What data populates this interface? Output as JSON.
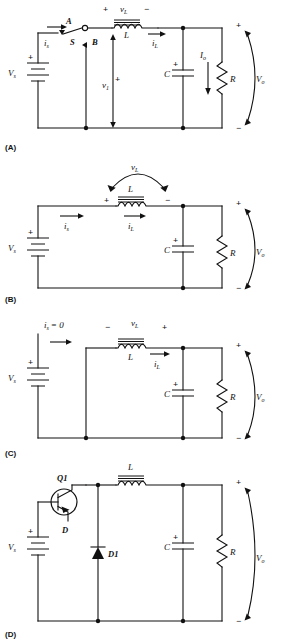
{
  "figure": {
    "panels": [
      "(A)",
      "(B)",
      "(C)",
      "(D)"
    ]
  },
  "common": {
    "source_label": "V",
    "source_sub": "s",
    "inductor_label": "L",
    "capacitor_label": "C",
    "resistor_label": "R",
    "vout_label": "V",
    "vout_sub": "o",
    "vl_label": "v",
    "vl_sub": "L",
    "il_label": "i",
    "il_sub": "L",
    "is_label": "i",
    "is_sub": "s",
    "plus": "+",
    "minus": "−"
  },
  "panelA": {
    "id": "(A)",
    "switch_label": "S",
    "switch_pos_a": "A",
    "switch_pos_b": "B",
    "is_label": "i",
    "is_sub": "s",
    "v1_label": "v",
    "v1_sub": "1",
    "v1_sign": "+",
    "vl_label": "v",
    "vl_sub": "L",
    "vl_left_sign": "+",
    "vl_right_sign": "−",
    "inductor_label": "L",
    "il_label": "i",
    "il_sub": "L",
    "io_label": "I",
    "io_sub": "o",
    "cap_label": "C",
    "cap_sign": "+",
    "res_label": "R",
    "src_label": "V",
    "src_sub": "s",
    "src_sign": "+",
    "vo_label": "V",
    "vo_sub": "o",
    "vo_top_sign": "+",
    "vo_bot_sign": "−"
  },
  "panelB": {
    "id": "(B)",
    "vl_label": "v",
    "vl_sub": "L",
    "vl_left_sign": "+",
    "vl_right_sign": "−",
    "inductor_label": "L",
    "is_label": "i",
    "is_sub": "s",
    "il_label": "i",
    "il_sub": "L",
    "cap_label": "C",
    "cap_sign": "+",
    "res_label": "R",
    "src_label": "V",
    "src_sub": "s",
    "src_sign": "+",
    "vo_label": "V",
    "vo_sub": "o",
    "vo_top_sign": "+",
    "vo_bot_sign": "−"
  },
  "panelC": {
    "id": "(C)",
    "is_zero_label": "i",
    "is_zero_sub": "s",
    "is_zero_eq": "= 0",
    "vl_label": "v",
    "vl_sub": "L",
    "vl_left_sign": "−",
    "vl_right_sign": "+",
    "inductor_label": "L",
    "il_label": "i",
    "il_sub": "L",
    "cap_label": "C",
    "cap_sign": "+",
    "res_label": "R",
    "src_label": "V",
    "src_sub": "s",
    "src_sign": "+",
    "vo_label": "V",
    "vo_sub": "o",
    "vo_top_sign": "+",
    "vo_bot_sign": "−"
  },
  "panelD": {
    "id": "(D)",
    "transistor_label": "Q1",
    "drive_label": "D",
    "diode_label": "D1",
    "inductor_label": "L",
    "cap_label": "C",
    "cap_sign": "+",
    "res_label": "R",
    "src_label": "V",
    "src_sub": "s",
    "src_sign": "+",
    "vo_label": "V",
    "vo_sub": "o",
    "vo_top_sign": "+",
    "vo_bot_sign": "−"
  },
  "colors": {
    "ink": "#111111",
    "background": "#ffffff"
  }
}
